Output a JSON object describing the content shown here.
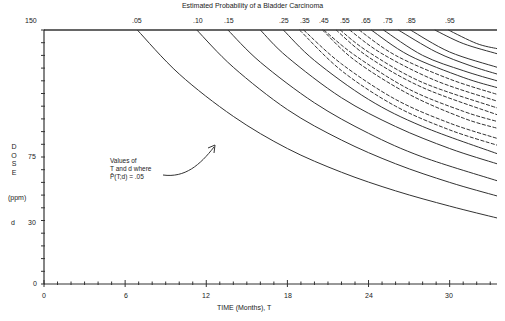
{
  "chart_data": {
    "type": "line",
    "title": "Estimated Probability of a Bladder Carcinoma",
    "xlabel": "TIME (Months), T",
    "ylabel": "DOSE (ppm) d",
    "xlim": [
      0,
      33.5
    ],
    "ylim": [
      0,
      150
    ],
    "x_ticks": [
      "0",
      "6",
      "12",
      "18",
      "24",
      "30"
    ],
    "y_ticks": [
      "0",
      "30",
      "75",
      "150"
    ],
    "grid": false,
    "legend": "contour labels along top edge",
    "contour_labels": [
      ".05",
      ".10",
      ".15",
      ".25",
      ".35",
      ".45",
      ".55",
      ".65",
      ".75",
      ".85",
      ".95"
    ],
    "series": [
      {
        "name": ".05",
        "style": "solid",
        "x": [
          6.9,
          10,
          14,
          18,
          22,
          26,
          30,
          33.5
        ],
        "y": [
          150,
          124,
          99,
          80,
          66,
          55,
          46,
          39
        ]
      },
      {
        "name": ".10",
        "style": "solid",
        "x": [
          11.3,
          14,
          18,
          22,
          26,
          30,
          33.5
        ],
        "y": [
          150,
          128,
          103,
          85,
          71,
          60,
          52
        ]
      },
      {
        "name": ".15",
        "style": "solid",
        "x": [
          13.6,
          16,
          20,
          24,
          28,
          33.5
        ],
        "y": [
          150,
          131,
          107,
          89,
          75,
          61
        ]
      },
      {
        "name": ".20",
        "style": "solid",
        "x": [
          16.0,
          18,
          22,
          26,
          30,
          33.5
        ],
        "y": [
          150,
          134,
          110,
          93,
          80,
          71
        ]
      },
      {
        "name": ".25",
        "style": "solid",
        "x": [
          17.7,
          20,
          24,
          28,
          33.5
        ],
        "y": [
          150,
          132,
          109,
          93,
          77
        ]
      },
      {
        "name": ".30",
        "style": "dashed",
        "x": [
          18.9,
          22,
          26,
          30,
          33.5
        ],
        "y": [
          150,
          126,
          105,
          91,
          82
        ]
      },
      {
        "name": ".35",
        "style": "dashed",
        "x": [
          19.2,
          22,
          26,
          30,
          33.5
        ],
        "y": [
          150,
          130,
          109,
          95,
          86
        ]
      },
      {
        "name": ".40",
        "style": "dashed",
        "x": [
          20.6,
          23,
          27,
          31,
          33.5
        ],
        "y": [
          150,
          132,
          112,
          98,
          92
        ]
      },
      {
        "name": ".45",
        "style": "dashed",
        "x": [
          20.7,
          23,
          27,
          31,
          33.5
        ],
        "y": [
          150,
          135,
          115,
          102,
          96
        ]
      },
      {
        "name": ".50",
        "style": "dashed",
        "x": [
          21.6,
          24,
          28,
          33.5
        ],
        "y": [
          150,
          134,
          116,
          100
        ]
      },
      {
        "name": ".55",
        "style": "dashed",
        "x": [
          21.9,
          24,
          28,
          33.5
        ],
        "y": [
          150,
          137,
          119,
          104
        ]
      },
      {
        "name": ".60",
        "style": "dashed",
        "x": [
          22.6,
          25,
          29,
          33.5
        ],
        "y": [
          150,
          136,
          120,
          108
        ]
      },
      {
        "name": ".65",
        "style": "dashed",
        "x": [
          23.3,
          26,
          30,
          33.5
        ],
        "y": [
          150,
          135,
          121,
          112
        ]
      },
      {
        "name": ".70",
        "style": "solid",
        "x": [
          24.2,
          27,
          31,
          33.5
        ],
        "y": [
          150,
          135,
          122,
          116
        ]
      },
      {
        "name": ".75",
        "style": "solid",
        "x": [
          25.1,
          28,
          31,
          33.5
        ],
        "y": [
          150,
          135,
          126,
          120
        ]
      },
      {
        "name": ".80",
        "style": "solid",
        "x": [
          26.2,
          29,
          31.5,
          33.5
        ],
        "y": [
          150,
          137,
          129,
          124
        ]
      },
      {
        "name": ".85",
        "style": "solid",
        "x": [
          27.1,
          30,
          33.5
        ],
        "y": [
          150,
          137,
          128
        ]
      },
      {
        "name": ".90",
        "style": "solid",
        "x": [
          28.9,
          31,
          33.5
        ],
        "y": [
          150,
          142,
          136
        ]
      },
      {
        "name": ".95",
        "style": "solid",
        "x": [
          29.9,
          32,
          33.5
        ],
        "y": [
          150,
          142,
          139
        ]
      }
    ],
    "annotations": [
      {
        "text": "Values of T and d where P̂(T;d) = .05",
        "points_to": ".05 curve"
      }
    ]
  },
  "title": "Estimated Probability of a Bladder Carcinoma",
  "xaxis": {
    "label": "TIME (Months), T",
    "ticks": [
      "0",
      "6",
      "12",
      "18",
      "24",
      "30"
    ]
  },
  "yaxis": {
    "letters": [
      "D",
      "O",
      "S",
      "E"
    ],
    "unit": "(ppm)",
    "symbol": "d",
    "ticks": [
      "150",
      "75",
      "30",
      "0"
    ]
  },
  "annotation": {
    "line1": "Values of",
    "line2": "T and d where",
    "line3": "P̂(T;d) = .05"
  },
  "top_labels": [
    ".05",
    ".10",
    ".15",
    ".25",
    ".35",
    ".45",
    ".55",
    ".65",
    ".75",
    ".85",
    ".95"
  ]
}
